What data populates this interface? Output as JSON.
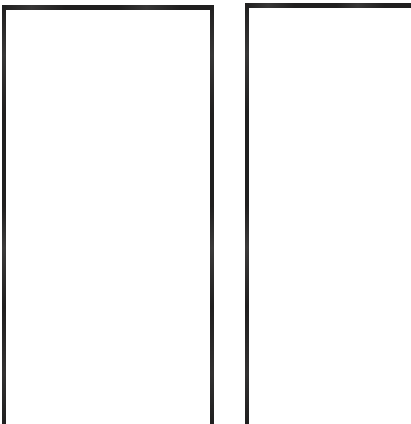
{
  "page": {
    "description": "Two tall open-bottom rectangular frames drawn in thick black rule on a white page",
    "width": 411,
    "height": 424,
    "background_color": "#ffffff",
    "ink_color": "#201f1f",
    "visible_text": ""
  },
  "frames": [
    {
      "name": "left-frame",
      "label": "",
      "content": "",
      "x": 2,
      "y": 5,
      "width": 212,
      "height": 419,
      "stroke_width": 4,
      "stroke_color": "#201f1f",
      "fill_color": "#ffffff",
      "edges": {
        "top": true,
        "left": true,
        "right": true,
        "bottom": false
      },
      "cropped_at": "bottom"
    },
    {
      "name": "right-frame",
      "label": "",
      "content": "",
      "x": 245,
      "y": 3,
      "width": 166,
      "height": 421,
      "stroke_width": 4,
      "stroke_color": "#201f1f",
      "fill_color": "#ffffff",
      "edges": {
        "top": true,
        "left": true,
        "right": false,
        "bottom": false
      },
      "cropped_at": "bottom-and-right"
    }
  ],
  "gutter": {
    "name": "column-gutter",
    "x": 214,
    "width": 31,
    "fill_color": "#ffffff"
  }
}
